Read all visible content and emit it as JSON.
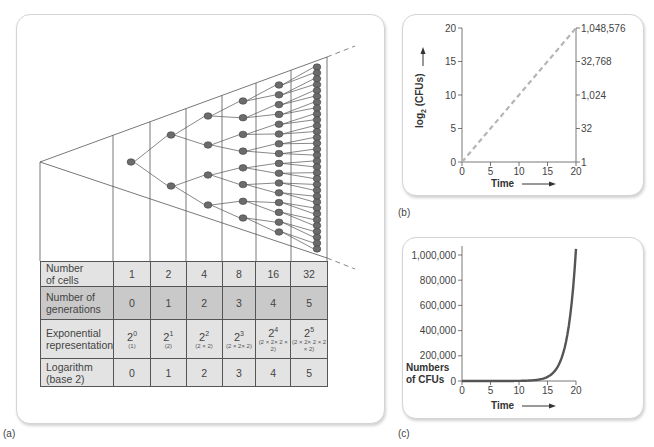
{
  "captions": {
    "a": "(a)",
    "b": "(b)",
    "c": "(c)"
  },
  "table": {
    "rows": [
      {
        "label": "Number of cells",
        "label_lines": [
          "Number",
          "of cells"
        ],
        "values": [
          "1",
          "2",
          "4",
          "8",
          "16",
          "32"
        ]
      },
      {
        "label": "Number of generations",
        "label_lines": [
          "Number of",
          "generations"
        ],
        "values": [
          "0",
          "1",
          "2",
          "3",
          "4",
          "5"
        ]
      },
      {
        "label": "Exponential representation",
        "label_lines": [
          "Exponential",
          "representation"
        ],
        "values": [
          {
            "base": "2",
            "exp": "0",
            "expansion": "(1)"
          },
          {
            "base": "2",
            "exp": "1",
            "expansion": "(2)"
          },
          {
            "base": "2",
            "exp": "2",
            "expansion": "(2 × 2)"
          },
          {
            "base": "2",
            "exp": "3",
            "expansion": "(2 × 2× 2)"
          },
          {
            "base": "2",
            "exp": "4",
            "expansion": "(2 × 2× 2 × 2)"
          },
          {
            "base": "2",
            "exp": "5",
            "expansion": "(2 × 2× 2 × 2 × 2)"
          }
        ]
      },
      {
        "label": "Logarithm (base 2)",
        "label_lines": [
          "Logarithm",
          "(base 2)"
        ],
        "values": [
          "0",
          "1",
          "2",
          "3",
          "4",
          "5"
        ]
      }
    ]
  },
  "chart_data": [
    {
      "type": "diagram-tree",
      "title": "Binary fission generations",
      "generations": [
        0,
        1,
        2,
        3,
        4,
        5
      ],
      "cells_per_generation": [
        1,
        2,
        4,
        8,
        16,
        32
      ]
    },
    {
      "type": "line",
      "title": "",
      "xlabel": "Time",
      "ylabel": "log2 (CFUs)",
      "ylabel_base": "log",
      "ylabel_sub": "2",
      "ylabel_rest": " (CFUs)",
      "x_ticks": [
        "0",
        "5",
        "10",
        "15",
        "20"
      ],
      "y_ticks": [
        "0",
        "5",
        "10",
        "15",
        "20"
      ],
      "y2_ticks": [
        "1",
        "32",
        "1,024",
        "32,768",
        "1,048,576"
      ],
      "xlim": [
        0,
        20
      ],
      "ylim": [
        0,
        20
      ],
      "series": [
        {
          "name": "log2 CFUs",
          "style": "dashed",
          "color": "#b5b5b5",
          "x": [
            0,
            20
          ],
          "y": [
            0,
            20
          ]
        }
      ]
    },
    {
      "type": "line",
      "title": "",
      "xlabel": "Time",
      "ylabel": "Numbers of CFUs",
      "ylabel_lines": [
        "Numbers",
        "of CFUs"
      ],
      "x_ticks": [
        "0",
        "5",
        "10",
        "15",
        "20"
      ],
      "y_ticks": [
        "0",
        "200,000",
        "400,000",
        "600,000",
        "800,000",
        "1,000,000"
      ],
      "xlim": [
        0,
        20
      ],
      "ylim": [
        0,
        1048576
      ],
      "series": [
        {
          "name": "CFUs",
          "style": "solid",
          "color": "#555555",
          "x": [
            0,
            2,
            4,
            6,
            8,
            10,
            12,
            13,
            14,
            15,
            16,
            17,
            18,
            19,
            20
          ],
          "y": [
            1,
            4,
            16,
            64,
            256,
            1024,
            4096,
            8192,
            16384,
            32768,
            65536,
            131072,
            262144,
            524288,
            1048576
          ]
        }
      ]
    }
  ]
}
